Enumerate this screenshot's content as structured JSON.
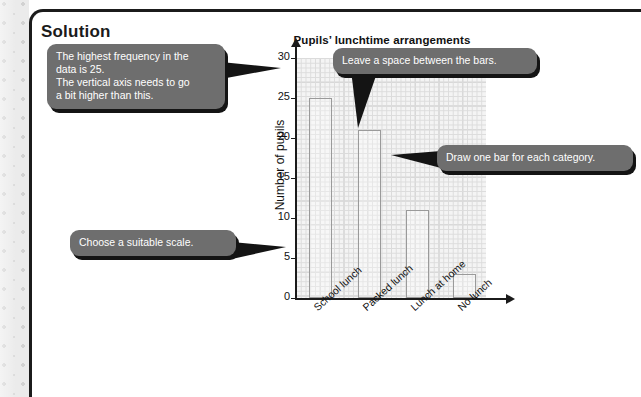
{
  "page": {
    "heading": "Solution"
  },
  "chart_data": {
    "type": "bar",
    "title": "Pupils’ lunchtime arrangements",
    "xlabel": "",
    "ylabel": "Number of pupils",
    "categories": [
      "School lunch",
      "Packed lunch",
      "Lunch at home",
      "No lunch"
    ],
    "values": [
      25,
      21,
      11,
      3
    ],
    "ylim": [
      0,
      30
    ],
    "yticks": [
      0,
      5,
      10,
      15,
      20,
      25,
      30
    ],
    "ytick_labels": [
      "0",
      "5",
      "10",
      "15",
      "20",
      "25",
      "30"
    ],
    "grid": true,
    "grid_minor_step": 1,
    "grid_major_step": 5,
    "legend": null,
    "bar_fill": "#ffffff",
    "bar_edge": "#9a9a9a",
    "plot_bg": "#f4f4f4"
  },
  "callouts": [
    {
      "id": "highest-frequency",
      "text": "The highest frequency in the\ndata is 25.\nThe vertical axis needs to go\na bit higher than this."
    },
    {
      "id": "leave-space",
      "text": "Leave a space between the bars."
    },
    {
      "id": "draw-one-bar",
      "text": "Draw one bar for each category."
    },
    {
      "id": "choose-scale",
      "text": "Choose a suitable scale."
    }
  ],
  "colors": {
    "callout_bg": "#6e6e6e",
    "callout_text": "#ffffff",
    "callout_shadow": "#141414",
    "panel_border": "#1b1b1b",
    "margin_bg": "#ebebeb"
  }
}
